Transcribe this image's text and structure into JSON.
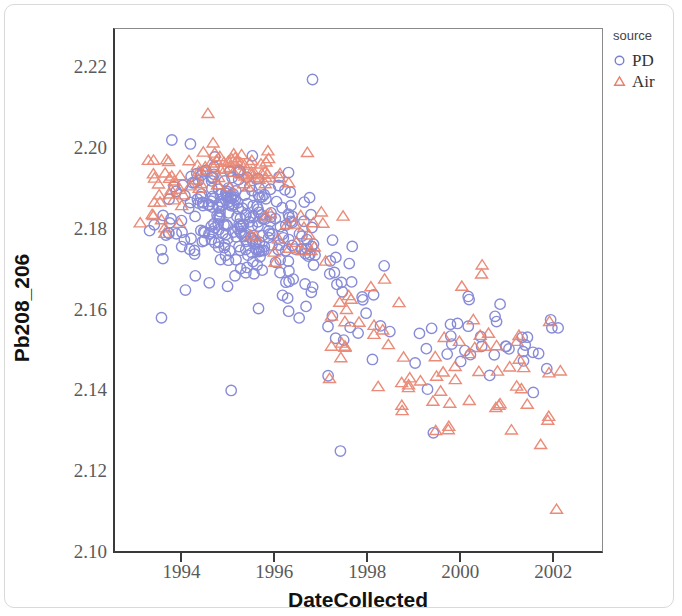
{
  "figure": {
    "background": "#ffffff",
    "frame_color": "#d9d9d9",
    "axis_color": "#3a3a3a"
  },
  "legend": {
    "title": "source",
    "entries": [
      {
        "label": "PD",
        "marker": "circle",
        "color": "#7b7fd4",
        "name": "legend-marker-pd"
      },
      {
        "label": "Air",
        "marker": "triangle",
        "color": "#e8806b",
        "name": "legend-marker-air"
      }
    ]
  },
  "chart_data": {
    "type": "scatter",
    "title": "",
    "xlabel": "DateCollected",
    "ylabel": "Pb208_206",
    "xlim": [
      1992.55,
      2003.05
    ],
    "ylim": [
      2.1,
      2.2295
    ],
    "xticks": [
      1994,
      1996,
      1998,
      2000,
      2002
    ],
    "xticklabels": [
      "1994",
      "1996",
      "1998",
      "2000",
      "2002"
    ],
    "yticks": [
      2.1,
      2.12,
      2.14,
      2.16,
      2.18,
      2.2,
      2.22
    ],
    "yticklabels": [
      "2.10",
      "2.12",
      "2.14",
      "2.16",
      "2.18",
      "2.20",
      "2.22"
    ],
    "grid": false,
    "legend_position": "right-outside",
    "marker_style": {
      "fill": "none",
      "stroke_width": 1.4,
      "size_px": 11
    },
    "series": [
      {
        "name": "PD",
        "marker": "circle",
        "color": "#7b7fd4",
        "count": 330,
        "note": "Blue open circles. Dense cluster 1993.8-1997.5 centered near 2.180, declining to ~2.150 by 1998-2002.",
        "clusters": [
          {
            "n": 150,
            "x_mean": 1995.15,
            "x_sd": 0.62,
            "y_mean": 2.1815,
            "y_sd": 0.0068
          },
          {
            "n": 70,
            "x_mean": 1996.25,
            "x_sd": 0.55,
            "y_mean": 2.175,
            "y_sd": 0.0075
          },
          {
            "n": 40,
            "x_mean": 1994.7,
            "x_sd": 0.45,
            "y_mean": 2.1905,
            "y_sd": 0.006
          },
          {
            "n": 26,
            "x_mean": 1997.45,
            "x_sd": 0.52,
            "y_mean": 2.1615,
            "y_sd": 0.0075
          },
          {
            "n": 16,
            "x_mean": 2000.3,
            "x_sd": 0.62,
            "y_mean": 2.1575,
            "y_sd": 0.006
          },
          {
            "n": 14,
            "x_mean": 2001.4,
            "x_sd": 0.55,
            "y_mean": 2.152,
            "y_sd": 0.005
          },
          {
            "n": 8,
            "x_mean": 1993.75,
            "x_sd": 0.28,
            "y_mean": 2.172,
            "y_sd": 0.009
          },
          {
            "n": 6,
            "x_mean": 1999.6,
            "x_sd": 0.45,
            "y_mean": 2.148,
            "y_sd": 0.0055
          }
        ],
        "explicit_points": [
          {
            "x": 1996.8,
            "y": 2.217
          },
          {
            "x": 1993.55,
            "y": 2.158
          },
          {
            "x": 1997.4,
            "y": 2.125
          },
          {
            "x": 1993.7,
            "y": 2.179
          },
          {
            "x": 2001.95,
            "y": 2.1555
          },
          {
            "x": 2001.55,
            "y": 2.1395
          },
          {
            "x": 1999.4,
            "y": 2.1295
          },
          {
            "x": 1995.05,
            "y": 2.14
          }
        ]
      },
      {
        "name": "Air",
        "marker": "triangle",
        "color": "#e8806b",
        "count": 175,
        "note": "Salmon open triangles. Upper band near 2.195 in 1993-1996, descending to 2.130-2.150 by 1999-2002.",
        "clusters": [
          {
            "n": 55,
            "x_mean": 1995.05,
            "x_sd": 0.6,
            "y_mean": 2.195,
            "y_sd": 0.0028
          },
          {
            "n": 26,
            "x_mean": 1993.65,
            "x_sd": 0.33,
            "y_mean": 2.1875,
            "y_sd": 0.0058
          },
          {
            "n": 24,
            "x_mean": 1996.35,
            "x_sd": 0.5,
            "y_mean": 2.183,
            "y_sd": 0.0055
          },
          {
            "n": 18,
            "x_mean": 1997.6,
            "x_sd": 0.5,
            "y_mean": 2.156,
            "y_sd": 0.007
          },
          {
            "n": 24,
            "x_mean": 2000.15,
            "x_sd": 0.55,
            "y_mean": 2.1455,
            "y_sd": 0.0075
          },
          {
            "n": 16,
            "x_mean": 2001.25,
            "x_sd": 0.55,
            "y_mean": 2.141,
            "y_sd": 0.006
          },
          {
            "n": 12,
            "x_mean": 1998.85,
            "x_sd": 0.45,
            "y_mean": 2.139,
            "y_sd": 0.0055
          }
        ],
        "explicit_points": [
          {
            "x": 1994.55,
            "y": 2.2085
          },
          {
            "x": 2002.05,
            "y": 2.1105
          },
          {
            "x": 2000.45,
            "y": 2.171
          },
          {
            "x": 1993.35,
            "y": 2.1835
          },
          {
            "x": 1993.4,
            "y": 2.1925
          },
          {
            "x": 1998.35,
            "y": 2.1675
          },
          {
            "x": 2001.9,
            "y": 2.157
          },
          {
            "x": 1999.45,
            "y": 2.13
          }
        ]
      }
    ]
  }
}
